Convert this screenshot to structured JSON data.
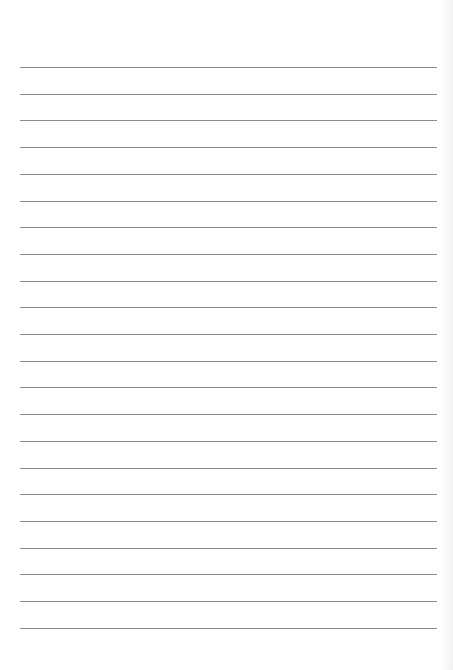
{
  "page": {
    "type": "lined-paper",
    "background_color": "#ffffff",
    "line_color": "#8c8c8c",
    "line_count": 22,
    "first_line_y": 67,
    "line_spacing": 26.7,
    "line_left": 20,
    "line_width": 417
  }
}
